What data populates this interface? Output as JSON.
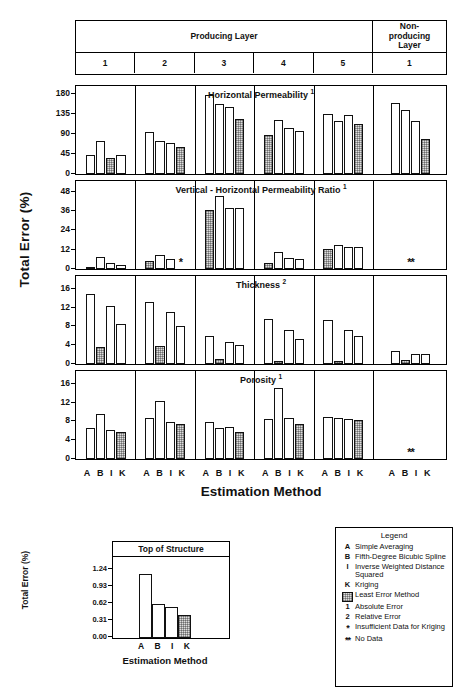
{
  "header": {
    "producing_label": "Producing Layer",
    "nonproducing_label": "Non-\nproducing\nLayer",
    "nonproducing_lines": [
      "Non-",
      "producing",
      "Layer"
    ],
    "producing_layers": [
      "1",
      "2",
      "3",
      "4",
      "5"
    ],
    "nonproducing_layers": [
      "1"
    ]
  },
  "axes": {
    "ylabel": "Total Error (%)",
    "xlabel": "Estimation Method",
    "methods": [
      "A",
      "B",
      "I",
      "K"
    ]
  },
  "legend": {
    "title": "Legend",
    "entries": [
      {
        "key": "A",
        "text": "Simple Averaging"
      },
      {
        "key": "B",
        "text": "Fifth-Degree Bicubic Spline"
      },
      {
        "key": "I",
        "text": "Inverse Weighted Distance Squared"
      },
      {
        "key": "K",
        "text": "Kriging"
      },
      {
        "key": "swatch",
        "text": "Least Error Method"
      },
      {
        "key": "1",
        "text": "Absolute Error"
      },
      {
        "key": "2",
        "text": "Relative Error"
      },
      {
        "key": "*",
        "text": "Insufficient Data for Kriging"
      },
      {
        "key": "**",
        "text": "No Data"
      }
    ]
  },
  "chart_data": [
    {
      "type": "bar",
      "title": "Horizontal Permeability",
      "title_superscript": "1",
      "ylabel": "Total Error (%)",
      "xlabel": "Estimation Method",
      "ylim": [
        0,
        195
      ],
      "yticks": [
        0,
        45,
        90,
        135,
        180
      ],
      "categories": [
        "A",
        "B",
        "I",
        "K"
      ],
      "groups": [
        {
          "layer": "1",
          "type": "producing",
          "values": [
            42,
            75,
            37,
            42
          ],
          "least_error": "I"
        },
        {
          "layer": "2",
          "type": "producing",
          "values": [
            95,
            73,
            70,
            60
          ],
          "least_error": "K"
        },
        {
          "layer": "3",
          "type": "producing",
          "values": [
            178,
            158,
            150,
            123
          ],
          "least_error": "K"
        },
        {
          "layer": "4",
          "type": "producing",
          "values": [
            88,
            120,
            103,
            97
          ],
          "least_error": "A"
        },
        {
          "layer": "5",
          "type": "producing",
          "values": [
            135,
            118,
            133,
            113
          ],
          "least_error": "K"
        },
        {
          "layer": "1",
          "type": "nonproducing",
          "values": [
            160,
            143,
            118,
            78
          ],
          "least_error": "K"
        }
      ]
    },
    {
      "type": "bar",
      "title": "Vertical - Horizontal Permeability Ratio",
      "title_superscript": "1",
      "ylabel": "Total Error (%)",
      "xlabel": "Estimation Method",
      "ylim": [
        0,
        54
      ],
      "yticks": [
        0,
        12,
        24,
        36,
        48
      ],
      "categories": [
        "A",
        "B",
        "I",
        "K"
      ],
      "groups": [
        {
          "layer": "1",
          "type": "producing",
          "values": [
            1.5,
            7.5,
            4.0,
            2.5
          ],
          "least_error": "A"
        },
        {
          "layer": "2",
          "type": "producing",
          "values": [
            5.0,
            8.5,
            6.5,
            null
          ],
          "least_error": "A",
          "note": "*"
        },
        {
          "layer": "3",
          "type": "producing",
          "values": [
            36.5,
            45.5,
            38.0,
            38.0
          ],
          "least_error": "A"
        },
        {
          "layer": "4",
          "type": "producing",
          "values": [
            4.0,
            10.5,
            7.0,
            6.0
          ],
          "least_error": "A"
        },
        {
          "layer": "5",
          "type": "producing",
          "values": [
            12.5,
            15.0,
            13.5,
            13.5
          ],
          "least_error": "A"
        },
        {
          "layer": "1",
          "type": "nonproducing",
          "values": [
            null,
            null,
            null,
            null
          ],
          "note": "**"
        }
      ]
    },
    {
      "type": "bar",
      "title": "Thickness",
      "title_superscript": "2",
      "ylabel": "Total Error (%)",
      "xlabel": "Estimation Method",
      "ylim": [
        0,
        18.5
      ],
      "yticks": [
        0,
        4,
        8,
        12,
        16
      ],
      "categories": [
        "A",
        "B",
        "I",
        "K"
      ],
      "groups": [
        {
          "layer": "1",
          "type": "producing",
          "values": [
            14.8,
            3.7,
            12.4,
            8.5
          ],
          "least_error": "B"
        },
        {
          "layer": "2",
          "type": "producing",
          "values": [
            13.1,
            3.9,
            11.0,
            8.0
          ],
          "least_error": "B"
        },
        {
          "layer": "3",
          "type": "producing",
          "values": [
            6.0,
            1.0,
            4.6,
            4.1
          ],
          "least_error": "B"
        },
        {
          "layer": "4",
          "type": "producing",
          "values": [
            9.5,
            0.6,
            7.3,
            5.3
          ],
          "least_error": "B"
        },
        {
          "layer": "5",
          "type": "producing",
          "values": [
            9.4,
            0.7,
            7.2,
            6.0
          ],
          "least_error": "B"
        },
        {
          "layer": "1",
          "type": "nonproducing",
          "values": [
            2.8,
            0.9,
            2.1,
            2.1
          ],
          "least_error": "B"
        }
      ]
    },
    {
      "type": "bar",
      "title": "Porosity",
      "title_superscript": "1",
      "ylabel": "Total Error (%)",
      "xlabel": "Estimation Method",
      "ylim": [
        0,
        18.5
      ],
      "yticks": [
        0,
        4,
        8,
        12,
        16
      ],
      "categories": [
        "A",
        "B",
        "I",
        "K"
      ],
      "groups": [
        {
          "layer": "1",
          "type": "producing",
          "values": [
            6.6,
            9.6,
            6.1,
            5.8
          ],
          "least_error": "K"
        },
        {
          "layer": "2",
          "type": "producing",
          "values": [
            8.8,
            12.4,
            7.8,
            7.4
          ],
          "least_error": "K"
        },
        {
          "layer": "3",
          "type": "producing",
          "values": [
            7.8,
            6.5,
            6.9,
            5.8
          ],
          "least_error": "K"
        },
        {
          "layer": "4",
          "type": "producing",
          "values": [
            8.6,
            15.0,
            8.8,
            7.4
          ],
          "least_error": "K"
        },
        {
          "layer": "5",
          "type": "producing",
          "values": [
            9.0,
            8.7,
            8.5,
            8.2
          ],
          "least_error": "K"
        },
        {
          "layer": "1",
          "type": "nonproducing",
          "values": [
            null,
            null,
            null,
            null
          ],
          "note": "**"
        }
      ]
    }
  ],
  "inset_chart": {
    "type": "bar",
    "title": "Top of Structure",
    "ylabel": "Total Error (%)",
    "xlabel": "Estimation Method",
    "ylim": [
      0,
      1.45
    ],
    "yticks": [
      "0.00",
      "0.31",
      "0.62",
      "0.93",
      "1.24"
    ],
    "ytick_values": [
      0,
      0.31,
      0.62,
      0.93,
      1.24
    ],
    "categories": [
      "A",
      "B",
      "I",
      "K"
    ],
    "values": [
      1.16,
      0.62,
      0.56,
      0.42
    ],
    "least_error": "K"
  }
}
